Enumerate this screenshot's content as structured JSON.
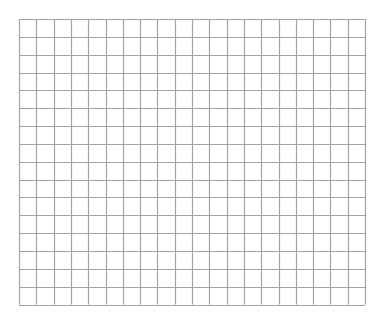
{
  "grid": {
    "columns": 20,
    "rows": 16,
    "origin_x": 19,
    "origin_y": 19,
    "width": 346,
    "height": 285.5,
    "line_color": "#a3a3a3",
    "background": "#ffffff"
  }
}
